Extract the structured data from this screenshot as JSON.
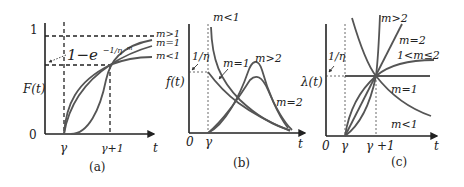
{
  "figure": {
    "panels": [
      {
        "id": "a",
        "caption": "(a)",
        "y_label": "F(t)",
        "x_label": "t",
        "y_ticks": [
          "1",
          "0"
        ],
        "x_ticks": [
          "γ",
          "γ+1"
        ],
        "annotation": "1−e",
        "annotation_exp": "−1/η",
        "annotation_exp_sup": "m",
        "curve_labels": [
          "m>1",
          "m=1",
          "m<1"
        ]
      },
      {
        "id": "b",
        "caption": "(b)",
        "y_label": "f(t)",
        "x_label": "t",
        "origin": "0",
        "x_ticks": [
          "γ"
        ],
        "annotation": "1/η",
        "curve_labels": [
          "m<1",
          "m=1",
          "m>2",
          "m=2"
        ]
      },
      {
        "id": "c",
        "caption": "(c)",
        "y_label": "λ(t)",
        "x_label": "t",
        "origin": "0",
        "x_ticks": [
          "γ",
          "γ +1"
        ],
        "annotation": "1/η",
        "curve_labels": [
          "m>2",
          "m=2",
          "1<m≤2",
          "m=1",
          "m<1"
        ]
      }
    ]
  },
  "colors": {
    "axis": "#222222",
    "curve": "#555555",
    "background": "#ffffff"
  }
}
